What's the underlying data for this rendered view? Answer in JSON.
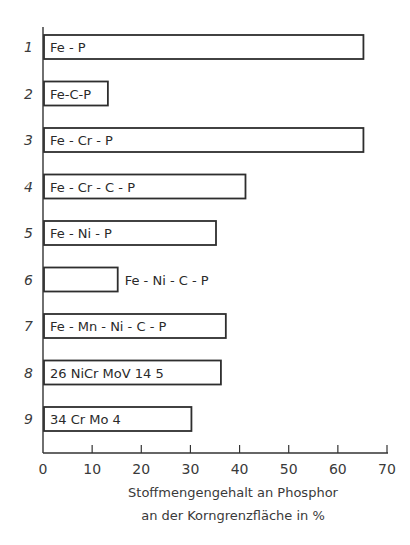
{
  "chart_data": {
    "type": "bar",
    "orientation": "horizontal",
    "title": "",
    "categories": [
      "Fe - P",
      "Fe-C-P",
      "Fe - Cr - P",
      "Fe - Cr - C - P",
      "Fe - Ni - P",
      "Fe - Ni - C - P",
      "Fe - Mn - Ni - C - P",
      "26 NiCr MoV 14 5",
      "34 Cr Mo 4"
    ],
    "row_numbers": [
      "1",
      "2",
      "3",
      "4",
      "5",
      "6",
      "7",
      "8",
      "9"
    ],
    "values": [
      65,
      13,
      65,
      41,
      35,
      15,
      37,
      36,
      30
    ],
    "label_outside": [
      false,
      false,
      false,
      false,
      false,
      true,
      false,
      false,
      false
    ],
    "xlabel_line1": "Stoffmengengehalt an Phosphor",
    "xlabel_line2": "an der Korngrenzfläche in %",
    "ylabel": "",
    "xlim": [
      0,
      70
    ],
    "xticks": [
      "0",
      "10",
      "20",
      "30",
      "40",
      "50",
      "60",
      "70"
    ],
    "grid": false,
    "legend": null
  }
}
